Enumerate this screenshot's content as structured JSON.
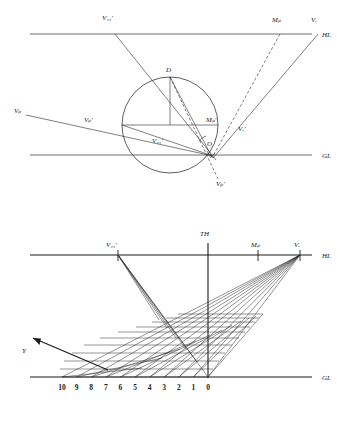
{
  "figure": {
    "ink_color": "#1a1a1a",
    "line_color": "#2a2a2a",
    "rule_color": "#6f6f6f"
  },
  "top_diagram": {
    "name": "plan-construction-with-vision-circle",
    "lines": {
      "horizon_label": "HL",
      "ground_label": "GL"
    },
    "labels": {
      "v45_top": "V₄₅'",
      "mp_top": "Mₚ",
      "vr_top": "Vᵣ",
      "d_apex": "D",
      "vp_far_left": "Vₚ",
      "vp_prime": "Vₚ'",
      "v45_prime": "V₄₅'",
      "mp_prime": "Mₚ'",
      "vr_prime": "Vᵣ'",
      "station_point": "O",
      "vp_double_prime": "Vₚ'"
    },
    "geometry": {
      "hl_y": 34,
      "gl_y": 155,
      "circle_center_x": 170,
      "circle_center_y": 125,
      "circle_radius": 48,
      "v45_x": 115,
      "mp_x": 280,
      "vr_x": 318,
      "station_x": 210,
      "station_y": 143
    }
  },
  "bottom_diagram": {
    "name": "perspective-grid",
    "lines": {
      "horizon_label": "HL",
      "ground_label": "GL",
      "true_height_label": "TH"
    },
    "labels": {
      "v45": "V₄₅'",
      "mp": "Mₚ",
      "vr": "Vᵣ",
      "y_axis": "Y"
    },
    "ground_scale": [
      "10",
      "9",
      "8",
      "7",
      "6",
      "5",
      "4",
      "3",
      "2",
      "1",
      "0"
    ],
    "geometry": {
      "hl_y": 255,
      "gl_y": 377,
      "th_x": 208,
      "v45_x": 118,
      "mp_x": 258,
      "vr_x": 300,
      "origin_x": 208,
      "unit_spacing": 14.6,
      "ray_count_right": 11,
      "ray_count_left": 6
    }
  }
}
